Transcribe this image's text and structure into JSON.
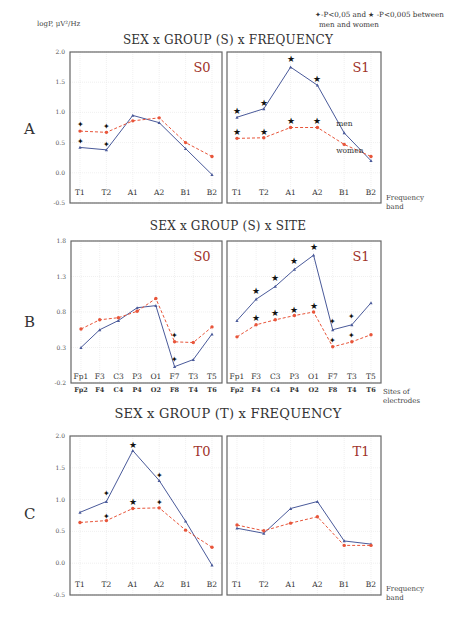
{
  "header": {
    "y_axis_label": "logP, μV²/Hz",
    "legend_line1": "✦-P<0,05 and ★ -P<0,005 between",
    "legend_line2": "men and women"
  },
  "sections": [
    {
      "letter": "A",
      "title": "SEX x GROUP (S) x FREQUENCY",
      "x_caption_1": "Frequency",
      "x_caption_2": "band"
    },
    {
      "letter": "B",
      "title": "SEX x GROUP (S) x SITE",
      "x_caption_1": "Sites of",
      "x_caption_2": "electrodes"
    },
    {
      "letter": "C",
      "title": "SEX x GROUP (T) x FREQUENCY",
      "x_caption_1": "Frequency",
      "x_caption_2": "band"
    }
  ],
  "colors": {
    "men": "#4a5a9a",
    "women": "#e8553a",
    "panel_label": "#a0322a",
    "frame": "#666666",
    "grid": "#e6e6e6"
  },
  "chart_data": [
    {
      "type": "line",
      "row": "A",
      "panel": "S0",
      "title": "SEX x GROUP (S) x FREQUENCY",
      "xlabel": "Frequency band",
      "ylabel": "logP, μV²/Hz",
      "ylim": [
        -0.5,
        2.0
      ],
      "yticks": [
        "2.0",
        "1.5",
        "1.0",
        "0.5",
        "0.0",
        "-0.5"
      ],
      "categories": [
        "T1",
        "T2",
        "A1",
        "A2",
        "B1",
        "B2"
      ],
      "series": [
        {
          "name": "men",
          "style": "solid",
          "values": [
            0.42,
            0.38,
            0.95,
            0.83,
            0.4,
            -0.03
          ]
        },
        {
          "name": "women",
          "style": "dashed",
          "values": [
            0.69,
            0.67,
            0.86,
            0.91,
            0.5,
            0.27
          ]
        }
      ],
      "markers": [
        {
          "category": "T1",
          "symbol": "cross",
          "y": 0.8
        },
        {
          "category": "T1",
          "symbol": "cross",
          "y": 0.52
        },
        {
          "category": "T2",
          "symbol": "cross",
          "y": 0.78
        },
        {
          "category": "T2",
          "symbol": "cross",
          "y": 0.47
        }
      ],
      "grid": true
    },
    {
      "type": "line",
      "row": "A",
      "panel": "S1",
      "ylim": [
        -0.5,
        2.0
      ],
      "categories": [
        "T1",
        "T2",
        "A1",
        "A2",
        "B1",
        "B2"
      ],
      "series": [
        {
          "name": "men",
          "style": "solid",
          "values": [
            0.92,
            1.06,
            1.75,
            1.45,
            0.66,
            0.2
          ]
        },
        {
          "name": "women",
          "style": "dashed",
          "values": [
            0.57,
            0.58,
            0.75,
            0.75,
            0.47,
            0.27
          ]
        }
      ],
      "annotations": [
        {
          "text": "men",
          "near": "B1",
          "y": 0.78
        },
        {
          "text": "women",
          "near": "B1",
          "y": 0.33
        }
      ],
      "markers": [
        {
          "category": "T1",
          "symbol": "star",
          "y": 1.02
        },
        {
          "category": "T2",
          "symbol": "star",
          "y": 1.16
        },
        {
          "category": "A1",
          "symbol": "star",
          "y": 1.88
        },
        {
          "category": "A2",
          "symbol": "star",
          "y": 1.56
        },
        {
          "category": "T1",
          "symbol": "star",
          "y": 0.67
        },
        {
          "category": "T2",
          "symbol": "star",
          "y": 0.68
        },
        {
          "category": "A1",
          "symbol": "star",
          "y": 0.85
        },
        {
          "category": "A2",
          "symbol": "star",
          "y": 0.86
        }
      ],
      "grid": true
    },
    {
      "type": "line",
      "row": "B",
      "panel": "S0",
      "title": "SEX x GROUP (S) x SITE",
      "xlabel": "Sites of electrodes",
      "ylim": [
        -0.2,
        1.8
      ],
      "yticks": [
        "1.8",
        "1.3",
        "0.8",
        "0.3",
        "-0.2"
      ],
      "categories": [
        "Fp1",
        "F3",
        "C3",
        "P3",
        "O1",
        "F7",
        "T3",
        "T5"
      ],
      "categories_secondary": [
        "Fp2",
        "F4",
        "C4",
        "P4",
        "O2",
        "F8",
        "T4",
        "T6"
      ],
      "series": [
        {
          "name": "men",
          "style": "solid",
          "values": [
            0.3,
            0.55,
            0.68,
            0.86,
            0.89,
            0.03,
            0.13,
            0.49
          ]
        },
        {
          "name": "women",
          "style": "dashed",
          "values": [
            0.56,
            0.69,
            0.72,
            0.81,
            0.99,
            0.38,
            0.37,
            0.59
          ]
        }
      ],
      "markers": [
        {
          "category": "F7",
          "symbol": "cross",
          "y": 0.48
        },
        {
          "category": "F7",
          "symbol": "cross",
          "y": 0.14
        }
      ],
      "grid": true
    },
    {
      "type": "line",
      "row": "B",
      "panel": "S1",
      "ylim": [
        -0.2,
        1.8
      ],
      "categories": [
        "Fp1",
        "F3",
        "C3",
        "P3",
        "O1",
        "F7",
        "T3",
        "T5"
      ],
      "categories_secondary": [
        "Fp2",
        "F4",
        "C4",
        "P4",
        "O2",
        "F8",
        "T4",
        "T6"
      ],
      "series": [
        {
          "name": "men",
          "style": "solid",
          "values": [
            0.68,
            0.98,
            1.16,
            1.4,
            1.6,
            0.55,
            0.62,
            0.93
          ]
        },
        {
          "name": "women",
          "style": "dashed",
          "values": [
            0.45,
            0.62,
            0.69,
            0.75,
            0.8,
            0.31,
            0.38,
            0.48
          ]
        }
      ],
      "markers": [
        {
          "category": "F3",
          "symbol": "star",
          "y": 1.1
        },
        {
          "category": "C3",
          "symbol": "star",
          "y": 1.28
        },
        {
          "category": "P3",
          "symbol": "star",
          "y": 1.52
        },
        {
          "category": "O1",
          "symbol": "star",
          "y": 1.72
        },
        {
          "category": "F3",
          "symbol": "star",
          "y": 0.72
        },
        {
          "category": "C3",
          "symbol": "star",
          "y": 0.79
        },
        {
          "category": "P3",
          "symbol": "star",
          "y": 0.83
        },
        {
          "category": "O1",
          "symbol": "star",
          "y": 0.88
        },
        {
          "category": "F7",
          "symbol": "cross",
          "y": 0.67
        },
        {
          "category": "T3",
          "symbol": "cross",
          "y": 0.74
        },
        {
          "category": "F7",
          "symbol": "cross",
          "y": 0.4
        },
        {
          "category": "T3",
          "symbol": "cross",
          "y": 0.48
        }
      ],
      "grid": true
    },
    {
      "type": "line",
      "row": "C",
      "panel": "T0",
      "title": "SEX x GROUP (T) x FREQUENCY",
      "xlabel": "Frequency band",
      "ylim": [
        -0.5,
        2.0
      ],
      "yticks": [
        "2.0",
        "1.5",
        "1.0",
        "0.5",
        "0.0",
        "-0.5"
      ],
      "categories": [
        "T1",
        "T2",
        "A1",
        "A2",
        "B1",
        "B2"
      ],
      "series": [
        {
          "name": "men",
          "style": "solid",
          "values": [
            0.8,
            0.97,
            1.77,
            1.3,
            0.66,
            -0.03
          ]
        },
        {
          "name": "women",
          "style": "dashed",
          "values": [
            0.64,
            0.67,
            0.86,
            0.87,
            0.52,
            0.25
          ]
        }
      ],
      "markers": [
        {
          "category": "T2",
          "symbol": "cross",
          "y": 1.1
        },
        {
          "category": "A1",
          "symbol": "star",
          "y": 1.86
        },
        {
          "category": "A2",
          "symbol": "cross",
          "y": 1.39
        },
        {
          "category": "T2",
          "symbol": "cross",
          "y": 0.75
        },
        {
          "category": "A1",
          "symbol": "star",
          "y": 0.97
        },
        {
          "category": "A2",
          "symbol": "cross",
          "y": 0.97
        }
      ],
      "grid": true
    },
    {
      "type": "line",
      "row": "C",
      "panel": "T1",
      "ylim": [
        -0.5,
        2.0
      ],
      "categories": [
        "T1",
        "T2",
        "A1",
        "A2",
        "B1",
        "B2"
      ],
      "series": [
        {
          "name": "men",
          "style": "solid",
          "values": [
            0.55,
            0.47,
            0.86,
            0.97,
            0.35,
            0.3
          ]
        },
        {
          "name": "women",
          "style": "dashed",
          "values": [
            0.6,
            0.51,
            0.63,
            0.73,
            0.28,
            0.28
          ]
        }
      ],
      "markers": [],
      "grid": true
    }
  ]
}
